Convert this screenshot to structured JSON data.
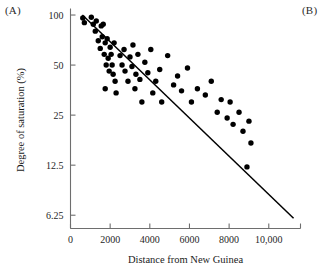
{
  "figure": {
    "panel_a_label": "(A)",
    "panel_b_label": "(B)"
  },
  "chart_data": {
    "type": "scatter",
    "title": "",
    "xlabel": "Distance from New Guinea",
    "ylabel": "Degree of saturation (%)",
    "grid": false,
    "legend": "none",
    "yscale": "log2",
    "xlim": [
      0,
      11600
    ],
    "ylim": [
      5.2,
      105
    ],
    "xticks": [
      0,
      2000,
      4000,
      6000,
      8000,
      10000
    ],
    "xticklabels": [
      "0",
      "2000",
      "4000",
      "6000",
      "8000",
      "10,000"
    ],
    "yticks": [
      100,
      50,
      25,
      12.5,
      6.25
    ],
    "yticklabels": [
      "100",
      "50",
      "25",
      "12.5",
      "6.25"
    ],
    "point_color": "#000000",
    "line_color": "#000000",
    "points": [
      [
        620,
        96
      ],
      [
        700,
        90
      ],
      [
        1050,
        97
      ],
      [
        1150,
        88
      ],
      [
        1250,
        80
      ],
      [
        1300,
        92
      ],
      [
        1400,
        70
      ],
      [
        1500,
        63
      ],
      [
        1550,
        86
      ],
      [
        1600,
        74
      ],
      [
        1650,
        88
      ],
      [
        1700,
        58
      ],
      [
        1750,
        68
      ],
      [
        1800,
        50
      ],
      [
        1850,
        72
      ],
      [
        1900,
        55
      ],
      [
        1950,
        46
      ],
      [
        2000,
        64
      ],
      [
        2050,
        58
      ],
      [
        2100,
        50
      ],
      [
        2150,
        44
      ],
      [
        2200,
        68
      ],
      [
        2250,
        40
      ],
      [
        2300,
        34
      ],
      [
        1750,
        36
      ],
      [
        2500,
        57
      ],
      [
        2600,
        50
      ],
      [
        2700,
        62
      ],
      [
        2750,
        46
      ],
      [
        2900,
        40
      ],
      [
        3000,
        56
      ],
      [
        3100,
        49
      ],
      [
        3150,
        66
      ],
      [
        3250,
        36
      ],
      [
        3300,
        44
      ],
      [
        3400,
        58
      ],
      [
        3500,
        41
      ],
      [
        3600,
        30
      ],
      [
        3750,
        52
      ],
      [
        3900,
        45
      ],
      [
        4050,
        62
      ],
      [
        4150,
        34
      ],
      [
        4300,
        40
      ],
      [
        4500,
        47
      ],
      [
        4600,
        30
      ],
      [
        4900,
        57
      ],
      [
        5200,
        38
      ],
      [
        5400,
        43
      ],
      [
        5600,
        35
      ],
      [
        5900,
        48
      ],
      [
        6100,
        30
      ],
      [
        6400,
        36
      ],
      [
        6800,
        33
      ],
      [
        7100,
        40
      ],
      [
        7400,
        26
      ],
      [
        7600,
        31
      ],
      [
        7900,
        24
      ],
      [
        8050,
        30
      ],
      [
        8200,
        22
      ],
      [
        8500,
        26
      ],
      [
        8700,
        20
      ],
      [
        8900,
        12.2
      ],
      [
        9000,
        23
      ],
      [
        9100,
        17
      ]
    ],
    "fit_line": {
      "x": [
        600,
        11250
      ],
      "y": [
        100,
        6.0
      ]
    }
  }
}
